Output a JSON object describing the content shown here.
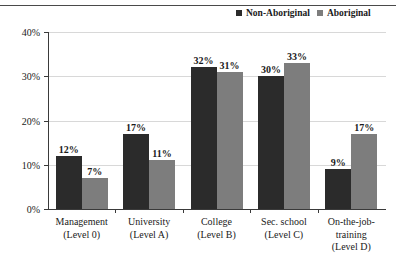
{
  "chart_data": {
    "type": "bar",
    "title": "",
    "xlabel": "",
    "ylabel": "",
    "ylim": [
      0,
      40
    ],
    "grid": true,
    "legend_position": "top-right",
    "categories": [
      "Management\n(Level 0)",
      "University\n(Level A)",
      "College\n(Level B)",
      "Sec. school\n(Level C)",
      "On-the-job-\ntraining\n(Level D)"
    ],
    "category_lines": [
      [
        "Management",
        "(Level 0)"
      ],
      [
        "University",
        "(Level A)"
      ],
      [
        "College",
        "(Level B)"
      ],
      [
        "Sec. school",
        "(Level C)"
      ],
      [
        "On-the-job-",
        "training",
        "(Level D)"
      ]
    ],
    "ytick_labels": [
      "0%",
      "10%",
      "20%",
      "30%",
      "40%"
    ],
    "ytick_values": [
      0,
      10,
      20,
      30,
      40
    ],
    "series": [
      {
        "name": "Non-Aboriginal",
        "color": "#2b2b2b",
        "values": [
          12,
          17,
          32,
          30,
          9
        ],
        "labels": [
          "12%",
          "17%",
          "32%",
          "30%",
          "9%"
        ]
      },
      {
        "name": "Aboriginal",
        "color": "#7d7d7d",
        "values": [
          7,
          11,
          31,
          33,
          17
        ],
        "labels": [
          "7%",
          "11%",
          "31%",
          "33%",
          "17%"
        ]
      }
    ]
  }
}
